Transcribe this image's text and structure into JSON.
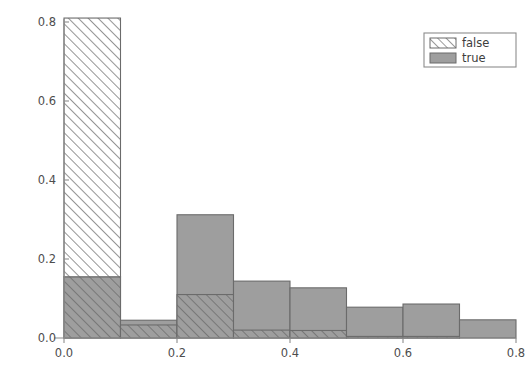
{
  "chart_data": {
    "type": "bar",
    "subtype": "overlaid-histogram",
    "title": "",
    "xlabel": "",
    "ylabel": "",
    "xlim": [
      0.0,
      0.8
    ],
    "ylim": [
      0.0,
      0.82
    ],
    "grid": false,
    "bin_width": 0.1,
    "bin_edges": [
      0.0,
      0.1,
      0.2,
      0.3,
      0.4,
      0.5,
      0.6,
      0.7,
      0.8
    ],
    "bin_starts": [
      0.0,
      0.1,
      0.2,
      0.3,
      0.4,
      0.5,
      0.6,
      0.7
    ],
    "xticks": [
      "0.0",
      "0.2",
      "0.4",
      "0.6",
      "0.8"
    ],
    "xtick_values": [
      0.0,
      0.2,
      0.4,
      0.6,
      0.8
    ],
    "yticks": [
      "0.0",
      "0.2",
      "0.4",
      "0.6",
      "0.8"
    ],
    "ytick_values": [
      0.0,
      0.2,
      0.4,
      0.6,
      0.8
    ],
    "legend_position": "upper right",
    "series": [
      {
        "name": "false",
        "style": "hatched",
        "hatch": "diagonal-forward",
        "fill": "#ffffff",
        "edge": "#6b6b6b",
        "values": [
          0.81,
          0.033,
          0.11,
          0.02,
          0.019,
          0.004,
          0.004,
          0.0
        ]
      },
      {
        "name": "true",
        "style": "solid",
        "fill": "#9e9e9e",
        "edge": "#6b6b6b",
        "values": [
          0.155,
          0.045,
          0.312,
          0.144,
          0.127,
          0.078,
          0.086,
          0.046
        ]
      }
    ]
  },
  "legend": {
    "entries": [
      {
        "label": "false",
        "swatch": "hatched"
      },
      {
        "label": "true",
        "swatch": "solid"
      }
    ]
  },
  "colors": {
    "gray_fill": "#9e9e9e",
    "edge": "#6b6b6b",
    "axis": "#8c8c8c",
    "text": "#4d4d4d",
    "background": "#ffffff"
  }
}
